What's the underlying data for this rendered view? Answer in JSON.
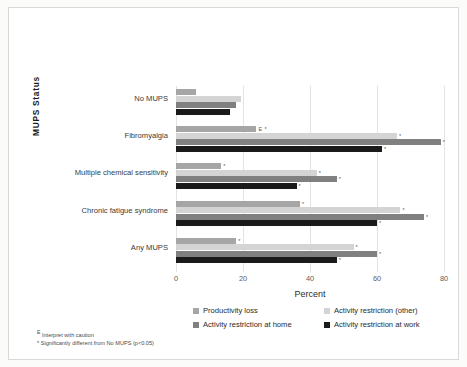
{
  "chart_data": {
    "type": "bar",
    "orientation": "horizontal",
    "title": "",
    "xlabel": "Percent",
    "ylabel": "MUPS Status",
    "xlim": [
      0,
      80
    ],
    "xticks": [
      0,
      20,
      40,
      60,
      80
    ],
    "grid": true,
    "legend_position": "bottom",
    "categories": [
      "No MUPS",
      "Fibromyalgia",
      "Multiple chemical sensitivity",
      "Chronic fatigue syndrome",
      "Any MUPS"
    ],
    "series": [
      {
        "name": "Productivity loss",
        "color": "#a6a6a6",
        "values": [
          6,
          24,
          13.5,
          37,
          18
        ],
        "annotations": [
          "",
          "E *",
          "*",
          "*",
          "*"
        ]
      },
      {
        "name": "Activity restriction (other)",
        "color": "#d4d4d4",
        "values": [
          19.5,
          66,
          42,
          67,
          53
        ],
        "annotations": [
          "",
          "*",
          "*",
          "*",
          "*"
        ]
      },
      {
        "name": "Activity restriction at home",
        "color": "#808080",
        "values": [
          18,
          79,
          48,
          74,
          60
        ],
        "annotations": [
          "",
          "*",
          "*",
          "*",
          "*"
        ]
      },
      {
        "name": "Activity restriction at work",
        "color": "#1a1a1a",
        "values": [
          16,
          61.5,
          36,
          60,
          48
        ],
        "annotations": [
          "",
          "*",
          "*",
          "*",
          "*"
        ]
      }
    ]
  },
  "footnotes": [
    "E Interpret with caution",
    "* Significantly different from No MUPS (p<0.05)"
  ]
}
